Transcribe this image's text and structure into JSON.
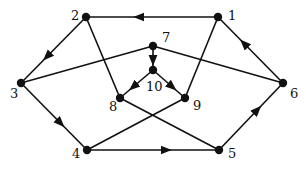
{
  "diagram": {
    "type": "directed-graph",
    "colors": {
      "stroke": "#111111",
      "background": "#ffffff"
    },
    "nodes": [
      {
        "id": "1",
        "label": "1",
        "x": 218,
        "y": 17,
        "lx": 228,
        "ly": 20
      },
      {
        "id": "2",
        "label": "2",
        "x": 86,
        "y": 17,
        "lx": 71,
        "ly": 20
      },
      {
        "id": "3",
        "label": "3",
        "x": 21,
        "y": 83,
        "lx": 10,
        "ly": 98
      },
      {
        "id": "4",
        "label": "4",
        "x": 87,
        "y": 150,
        "lx": 72,
        "ly": 158
      },
      {
        "id": "5",
        "label": "5",
        "x": 219,
        "y": 150,
        "lx": 228,
        "ly": 158
      },
      {
        "id": "6",
        "label": "6",
        "x": 283,
        "y": 83,
        "lx": 290,
        "ly": 98
      },
      {
        "id": "7",
        "label": "7",
        "x": 153,
        "y": 46,
        "lx": 162,
        "ly": 42
      },
      {
        "id": "8",
        "label": "8",
        "x": 120,
        "y": 98,
        "lx": 109,
        "ly": 111
      },
      {
        "id": "9",
        "label": "9",
        "x": 185,
        "y": 98,
        "lx": 193,
        "ly": 110
      },
      {
        "id": "10",
        "label": "10",
        "x": 153,
        "y": 70,
        "lx": 146,
        "ly": 91
      }
    ],
    "edges": [
      {
        "from": "1",
        "to": "2",
        "directed": true
      },
      {
        "from": "2",
        "to": "3",
        "directed": true
      },
      {
        "from": "3",
        "to": "4",
        "directed": true
      },
      {
        "from": "4",
        "to": "5",
        "directed": true
      },
      {
        "from": "5",
        "to": "6",
        "directed": true
      },
      {
        "from": "6",
        "to": "1",
        "directed": true
      },
      {
        "from": "7",
        "to": "10",
        "directed": true
      },
      {
        "from": "10",
        "to": "8",
        "directed": true
      },
      {
        "from": "10",
        "to": "9",
        "directed": true
      },
      {
        "from": "2",
        "to": "8",
        "directed": false
      },
      {
        "from": "1",
        "to": "9",
        "directed": false
      },
      {
        "from": "3",
        "to": "7",
        "directed": false
      },
      {
        "from": "6",
        "to": "7",
        "directed": false
      },
      {
        "from": "8",
        "to": "5",
        "directed": false
      },
      {
        "from": "9",
        "to": "4",
        "directed": false
      }
    ]
  }
}
